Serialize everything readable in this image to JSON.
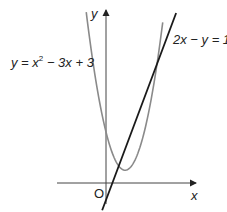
{
  "diagram": {
    "type": "coordinate-graph",
    "axes": {
      "x_label": "x",
      "y_label": "y",
      "origin_label": "O"
    },
    "curves": [
      {
        "id": "parabola",
        "equation_label_prefix": "y = x",
        "equation_label_exp": "2",
        "equation_label_suffix": " − 3x + 3",
        "color": "#8a8a8a",
        "a": 1,
        "b": -3,
        "c": 3,
        "x_range": [
          -1.55,
          4.45
        ]
      },
      {
        "id": "line",
        "equation_label": "2x − y = 1",
        "color": "#1a1a1a",
        "slope": 2,
        "intercept": -1,
        "x_range": [
          -0.3,
          5.5
        ]
      }
    ],
    "intersections": [
      {
        "x": 1,
        "y": 1
      },
      {
        "x": 4,
        "y": 7
      }
    ],
    "vertex": {
      "x": 1.5,
      "y": 0.75
    }
  },
  "render": {
    "origin_px": [
      106,
      183
    ],
    "scale_x": 12.75,
    "scale_y": 17.0,
    "x_axis_px": [
      57,
      196
    ],
    "y_axis_px": [
      10,
      204
    ],
    "parabola_color": "#8a8a8a",
    "line_color": "#1a1a1a",
    "axis_color": "#444444"
  }
}
